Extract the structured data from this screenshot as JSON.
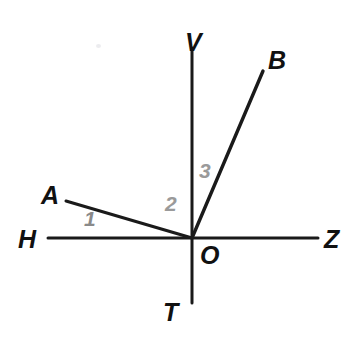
{
  "figure": {
    "width": 363,
    "height": 347,
    "background_color": "#ffffff",
    "line_color": "#1a1a1a",
    "label_color": "#111111",
    "angle_label_color": "#9a9a9a"
  },
  "points": {
    "V": {
      "label": "V",
      "x": 185,
      "y": 30
    },
    "B": {
      "label": "B",
      "x": 268,
      "y": 48
    },
    "A": {
      "label": "A",
      "x": 41,
      "y": 183
    },
    "H": {
      "label": "H",
      "x": 18,
      "y": 227
    },
    "O": {
      "label": "O",
      "x": 200,
      "y": 243
    },
    "Z": {
      "label": "Z",
      "x": 324,
      "y": 227
    },
    "T": {
      "label": "T",
      "x": 163,
      "y": 300
    }
  },
  "angles": {
    "one": {
      "label": "1",
      "x": 84,
      "y": 208
    },
    "two": {
      "label": "2",
      "x": 165,
      "y": 193
    },
    "three": {
      "label": "3",
      "x": 199,
      "y": 160
    }
  },
  "geometry": {
    "origin": {
      "x": 192,
      "y": 238
    },
    "lines": [
      {
        "name": "vertical-axis-VT",
        "x1": 192,
        "y1": 48,
        "x2": 192,
        "y2": 303,
        "width": 3
      },
      {
        "name": "horizontal-axis-HZ",
        "x1": 48,
        "y1": 238,
        "x2": 318,
        "y2": 238,
        "width": 3
      },
      {
        "name": "ray-OA",
        "x1": 192,
        "y1": 238,
        "x2": 66,
        "y2": 201,
        "width": 3
      },
      {
        "name": "ray-OB",
        "x1": 192,
        "y1": 238,
        "x2": 263,
        "y2": 71,
        "width": 3.4
      }
    ]
  }
}
